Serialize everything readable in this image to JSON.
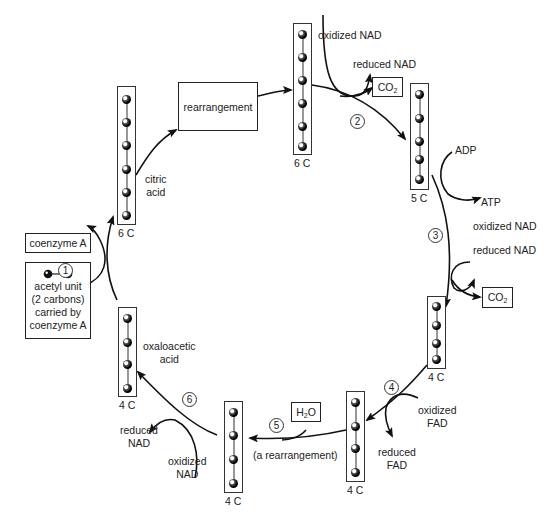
{
  "diagram": {
    "molecules": [
      {
        "id": "citric-acid",
        "carbons": 6,
        "label": "6 C",
        "name": "citric\nacid"
      },
      {
        "id": "isocitrate",
        "carbons": 6,
        "label": "6 C"
      },
      {
        "id": "alpha-ketoglutarate",
        "carbons": 5,
        "label": "5 C"
      },
      {
        "id": "succinate",
        "carbons": 4,
        "label": "4 C"
      },
      {
        "id": "fumarate",
        "carbons": 4,
        "label": "4 C"
      },
      {
        "id": "malate",
        "carbons": 4,
        "label": "4 C"
      },
      {
        "id": "oxaloacetic-acid",
        "carbons": 4,
        "label": "4 C",
        "name": "oxaloacetic\nacid"
      }
    ],
    "boxes": {
      "rearrangement": "rearrangement",
      "coenzyme_a": "coenzyme A",
      "acetyl_unit": "acetyl unit\n(2 carbons)\ncarried by\ncoenzyme A",
      "co2_step2": "CO2",
      "co2_step3": "CO2",
      "h2o": "H2O"
    },
    "steps": [
      "1",
      "2",
      "3",
      "4",
      "5",
      "6"
    ],
    "labels": {
      "citric_acid_l1": "citric",
      "citric_acid_l2": "acid",
      "oxaloacetic_l1": "oxaloacetic",
      "oxaloacetic_l2": "acid",
      "step2_oxidized_nad": "oxidized NAD",
      "step2_reduced_nad": "reduced NAD",
      "step3_adp": "ADP",
      "step3_atp": "ATP",
      "step3_oxidized_nad": "oxidized  NAD",
      "step3_reduced_nad": "reduced  NAD",
      "step4_oxidized_fad_l1": "oxidized",
      "step4_oxidized_fad_l2": "FAD",
      "step4_reduced_fad_l1": "reduced",
      "step4_reduced_fad_l2": "FAD",
      "step5_note": "(a rearrangement)",
      "step6_reduced_nad_l1": "reduced",
      "step6_reduced_nad_l2": "NAD",
      "step6_oxidized_nad_l1": "oxidized",
      "step6_oxidized_nad_l2": "NAD",
      "acetyl_l1": "acetyl unit",
      "acetyl_l2": "(2 carbons)",
      "acetyl_l3": "carried by",
      "acetyl_l4": "coenzyme A",
      "co2_main": "CO",
      "co2_sub": "2",
      "h2o_h": "H",
      "h2o_sub": "2",
      "h2o_o": "O"
    },
    "carbon_labels": [
      "6 C",
      "6 C",
      "5 C",
      "4 C",
      "4 C",
      "4 C",
      "4 C"
    ]
  }
}
